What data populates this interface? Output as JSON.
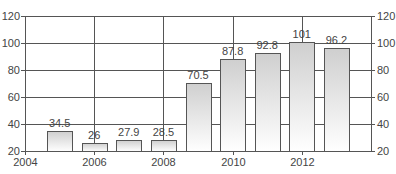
{
  "chart_data": {
    "type": "bar",
    "title": "",
    "xlabel": "",
    "ylabel": "",
    "x": [
      2005,
      2006,
      2007,
      2008,
      2009,
      2010,
      2011,
      2012,
      2013
    ],
    "values": [
      34.5,
      26,
      27.9,
      28.5,
      70.5,
      87.8,
      92.8,
      101,
      96.2
    ],
    "value_labels": [
      "34.5",
      "26",
      "27.9",
      "28.5",
      "70.5",
      "87.8",
      "92.8",
      "101",
      "96.2"
    ],
    "xlim": [
      2004,
      2014
    ],
    "ylim": [
      20,
      120
    ],
    "x_ticks": [
      "2004",
      "2006",
      "2008",
      "2010",
      "2012"
    ],
    "y_ticks_left": [
      "20",
      "40",
      "60",
      "80",
      "100",
      "120"
    ],
    "y_ticks_right": [
      "20",
      "40",
      "60",
      "80",
      "100",
      "120"
    ],
    "grid": true,
    "legend": null,
    "colors": {
      "bar_top": "#d2d2d2",
      "bar_bottom": "#ffffff",
      "bar_stroke": "#555555",
      "grid": "#555555"
    }
  }
}
